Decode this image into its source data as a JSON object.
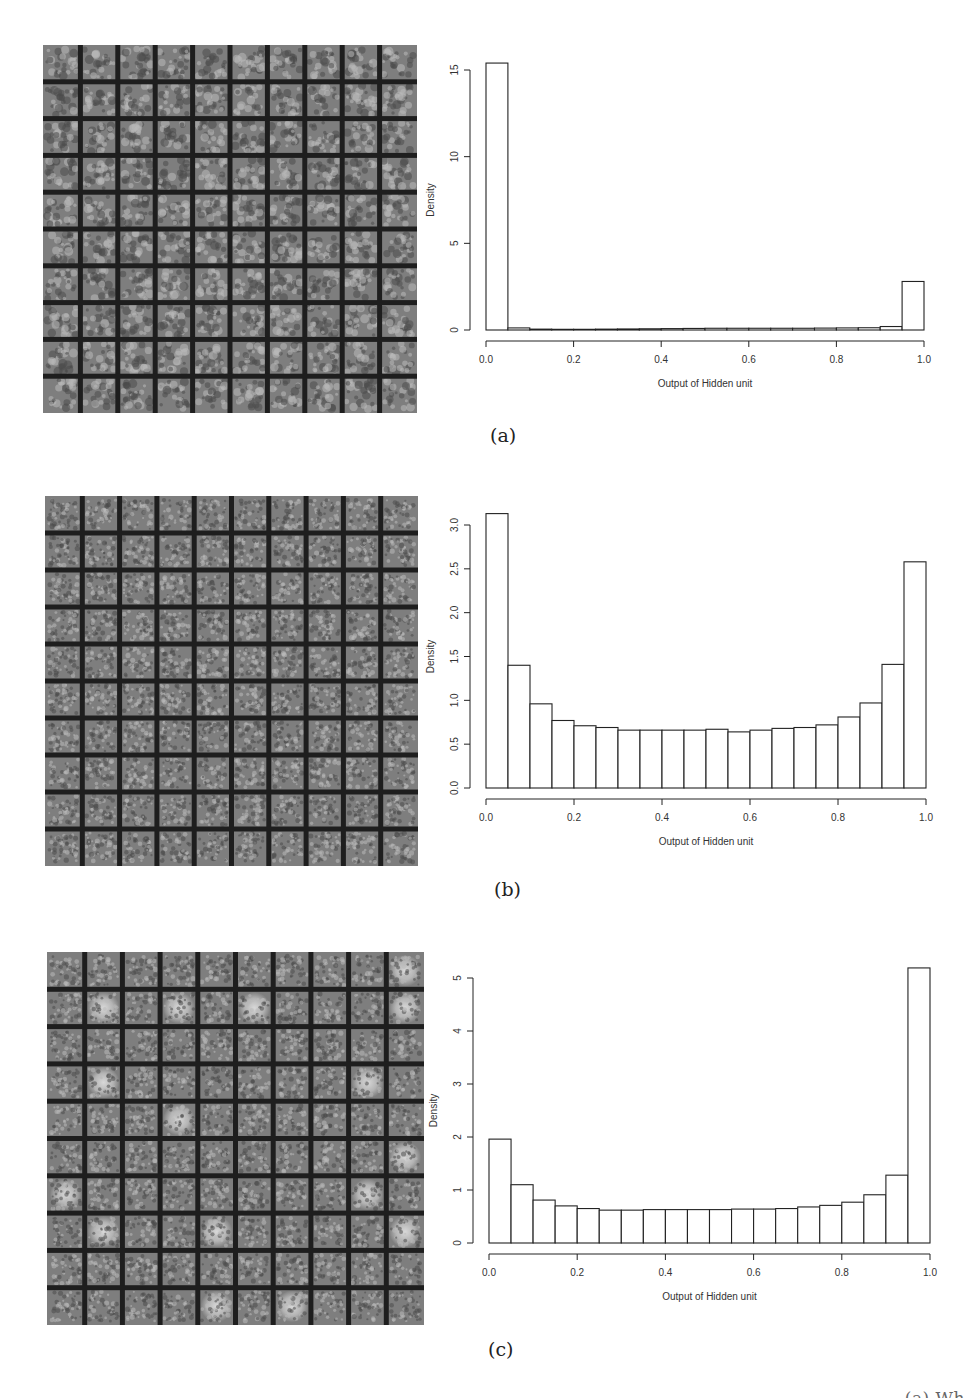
{
  "figure": {
    "panels": [
      {
        "id": "a",
        "label": "(a)",
        "weights_grid": {
          "rows": 10,
          "cols": 10,
          "style": "digit-like strokes",
          "bright_cells": []
        },
        "hist_ylabel": "Density",
        "hist_xlabel": "Output of Hidden unit"
      },
      {
        "id": "b",
        "label": "(b)",
        "weights_grid": {
          "rows": 10,
          "cols": 10,
          "style": "fine noise",
          "bright_cells": []
        },
        "hist_ylabel": "Density",
        "hist_xlabel": "Output of Hidden unit"
      },
      {
        "id": "c",
        "label": "(c)",
        "weights_grid": {
          "rows": 10,
          "cols": 10,
          "style": "noise with bright blobs",
          "bright_cells": [
            [
              0,
              9
            ],
            [
              1,
              1
            ],
            [
              1,
              3
            ],
            [
              1,
              5
            ],
            [
              1,
              9
            ],
            [
              3,
              1
            ],
            [
              3,
              8
            ],
            [
              4,
              3
            ],
            [
              5,
              9
            ],
            [
              6,
              0
            ],
            [
              6,
              8
            ],
            [
              7,
              1
            ],
            [
              7,
              4
            ],
            [
              7,
              9
            ],
            [
              9,
              4
            ],
            [
              9,
              6
            ]
          ]
        },
        "hist_ylabel": "Density",
        "hist_xlabel": "Output of Hidden unit"
      }
    ],
    "cut_off_caption": "(a) Wh"
  },
  "chart_data": [
    {
      "type": "bar",
      "title": "",
      "panel": "(a)",
      "xlabel": "Output of Hidden unit",
      "ylabel": "Density",
      "bins": [
        0.0,
        0.05,
        0.1,
        0.15,
        0.2,
        0.25,
        0.3,
        0.35,
        0.4,
        0.45,
        0.5,
        0.55,
        0.6,
        0.65,
        0.7,
        0.75,
        0.8,
        0.85,
        0.9,
        0.95,
        1.0
      ],
      "values": [
        15.4,
        0.12,
        0.05,
        0.04,
        0.04,
        0.05,
        0.06,
        0.07,
        0.08,
        0.09,
        0.1,
        0.1,
        0.1,
        0.1,
        0.1,
        0.11,
        0.12,
        0.13,
        0.2,
        2.8
      ],
      "xticks": [
        "0.0",
        "0.2",
        "0.4",
        "0.6",
        "0.8",
        "1.0"
      ],
      "yticks": [
        "0",
        "5",
        "10",
        "15"
      ],
      "ylim": [
        0,
        15.5
      ],
      "grid": false
    },
    {
      "type": "bar",
      "title": "",
      "panel": "(b)",
      "xlabel": "Output of Hidden unit",
      "ylabel": "Density",
      "bins": [
        0.0,
        0.05,
        0.1,
        0.15,
        0.2,
        0.25,
        0.3,
        0.35,
        0.4,
        0.45,
        0.5,
        0.55,
        0.6,
        0.65,
        0.7,
        0.75,
        0.8,
        0.85,
        0.9,
        0.95,
        1.0
      ],
      "values": [
        3.13,
        1.4,
        0.96,
        0.77,
        0.71,
        0.69,
        0.66,
        0.66,
        0.66,
        0.66,
        0.67,
        0.64,
        0.66,
        0.68,
        0.69,
        0.72,
        0.81,
        0.97,
        1.41,
        2.58
      ],
      "xticks": [
        "0.0",
        "0.2",
        "0.4",
        "0.6",
        "0.8",
        "1.0"
      ],
      "yticks": [
        "0.0",
        "0.5",
        "1.0",
        "1.5",
        "2.0",
        "2.5",
        "3.0"
      ],
      "ylim": [
        0,
        3.1
      ],
      "grid": false
    },
    {
      "type": "bar",
      "title": "",
      "panel": "(c)",
      "xlabel": "Output of Hidden unit",
      "ylabel": "Density",
      "bins": [
        0.0,
        0.05,
        0.1,
        0.15,
        0.2,
        0.25,
        0.3,
        0.35,
        0.4,
        0.45,
        0.5,
        0.55,
        0.6,
        0.65,
        0.7,
        0.75,
        0.8,
        0.85,
        0.9,
        0.95,
        1.0
      ],
      "values": [
        1.96,
        1.1,
        0.81,
        0.7,
        0.65,
        0.62,
        0.62,
        0.63,
        0.63,
        0.63,
        0.63,
        0.64,
        0.64,
        0.65,
        0.68,
        0.71,
        0.77,
        0.91,
        1.28,
        5.19
      ],
      "xticks": [
        "0.0",
        "0.2",
        "0.4",
        "0.6",
        "0.8",
        "1.0"
      ],
      "yticks": [
        "0",
        "1",
        "2",
        "3",
        "4",
        "5"
      ],
      "ylim": [
        0,
        5
      ],
      "grid": false
    }
  ]
}
